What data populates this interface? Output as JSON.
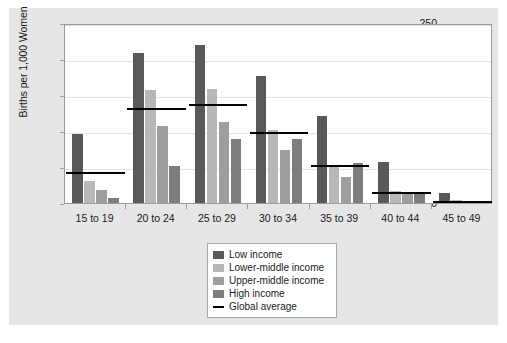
{
  "chart_data": {
    "type": "bar",
    "title": "",
    "subtitle": "",
    "xlabel": "",
    "ylabel": "Births per 1,000 Women",
    "ylim": [
      0,
      250
    ],
    "ytick_values": [
      0,
      50,
      100,
      150,
      200,
      250
    ],
    "ytick_labels": [
      "0",
      "50",
      "100",
      "150",
      "200",
      "250"
    ],
    "grid": true,
    "grid_axis": "y",
    "legend_position": "bottom-center",
    "categories": [
      "15 to 19",
      "20 to 24",
      "25 to 29",
      "30 to 34",
      "35 to 39",
      "40 to 44",
      "45 to 49"
    ],
    "series": [
      {
        "name": "Low income",
        "color": "#595959",
        "values": [
          96,
          208,
          220,
          177,
          121,
          57,
          14
        ]
      },
      {
        "name": "Lower-middle income",
        "color": "#b8b8b8",
        "values": [
          31,
          157,
          159,
          101,
          53,
          17,
          4
        ]
      },
      {
        "name": "Upper-middle income",
        "color": "#9e9e9e",
        "values": [
          18,
          107,
          113,
          74,
          36,
          13,
          3
        ]
      },
      {
        "name": "High income",
        "color": "#7d7d7d",
        "values": [
          7,
          52,
          89,
          89,
          56,
          15,
          3
        ]
      }
    ],
    "reference_series": {
      "name": "Global average",
      "color": "#000000",
      "style": "line-segments",
      "values": [
        44,
        133,
        139,
        100,
        54,
        17,
        4
      ]
    }
  },
  "legend": {
    "entries": [
      {
        "label": "Low income",
        "swatch_kind": "fill",
        "color": "#595959"
      },
      {
        "label": "Lower-middle income",
        "swatch_kind": "fill",
        "color": "#b8b8b8"
      },
      {
        "label": "Upper-middle income",
        "swatch_kind": "fill",
        "color": "#9e9e9e"
      },
      {
        "label": "High income",
        "swatch_kind": "fill",
        "color": "#7d7d7d"
      },
      {
        "label": "Global average",
        "swatch_kind": "line",
        "color": "#000000"
      }
    ]
  },
  "colors": {
    "figure_background": "#e6e6e6",
    "plot_background": "#ffffff",
    "axis": "#9b9b9b",
    "gridline": "#e3e3e3",
    "text": "#1a1a1a"
  }
}
